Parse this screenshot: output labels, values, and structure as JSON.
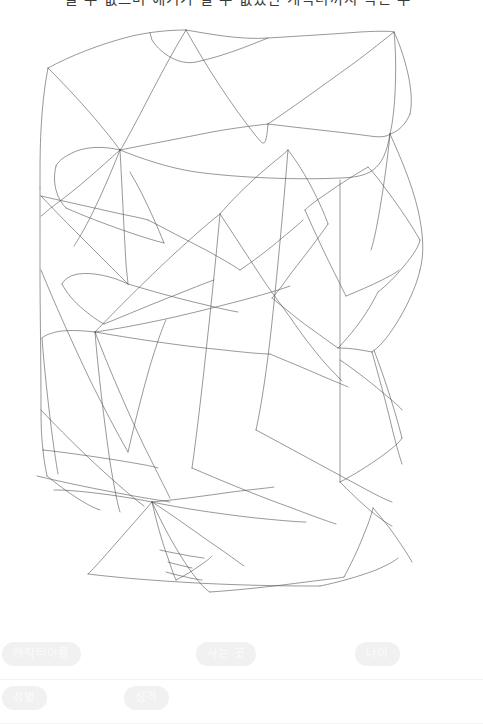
{
  "page": {
    "background_color": "#ffffff",
    "width": 483,
    "height": 720
  },
  "header": {
    "clipped_heading_text": "절 수 없으며 얘기가 잘 수 없었던 캐릭터까지 적은 수"
  },
  "sketch": {
    "title": "hand-drawn-polygon-wireframe",
    "stroke_color": "#4a4a4a",
    "stroke_width": 0.62,
    "description": "Hand-drawn overlapping polygonal / triangulated wireframe sketch filling the upper canvas"
  },
  "form": {
    "rows": [
      {
        "fields": [
          {
            "key": "character_name",
            "label": "캐릭터이름",
            "value": "",
            "placeholder": ""
          },
          {
            "key": "residence",
            "label": "사는 곳",
            "value": "",
            "placeholder": ""
          },
          {
            "key": "age",
            "label": "나이",
            "value": "",
            "placeholder": ""
          }
        ]
      },
      {
        "fields": [
          {
            "key": "gender",
            "label": "성별",
            "value": "",
            "placeholder": ""
          },
          {
            "key": "personality",
            "label": "성격",
            "value": "",
            "placeholder": ""
          }
        ]
      }
    ],
    "label_pill_color": "#f1f1f1",
    "label_text_color": "#fbfbfb",
    "underline_color": "#f2f2f2"
  }
}
